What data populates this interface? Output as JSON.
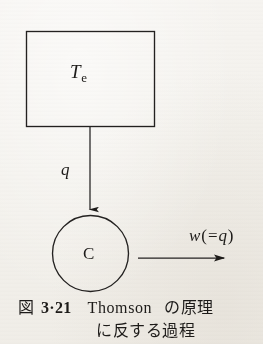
{
  "figure": {
    "background_color": "#f4f2ef",
    "ink_color": "#1d1b19",
    "reservoir": {
      "label_main": "T",
      "label_sub": "e",
      "shape": "rectangle"
    },
    "engine": {
      "label": "C",
      "shape": "circle"
    },
    "heat_arrow": {
      "label": "q",
      "direction": "down",
      "from": "reservoir",
      "to": "engine"
    },
    "work_arrow": {
      "label_var": "w",
      "label_open_paren": "(",
      "label_eq": "=",
      "label_value": "q",
      "label_close_paren": ")",
      "direction": "right",
      "from": "engine"
    }
  },
  "caption": {
    "fig_word": "図",
    "fig_number": "3·21",
    "roman_name": "Thomson",
    "line1_jp": "の原理",
    "line2_jp": "に反する過程"
  }
}
